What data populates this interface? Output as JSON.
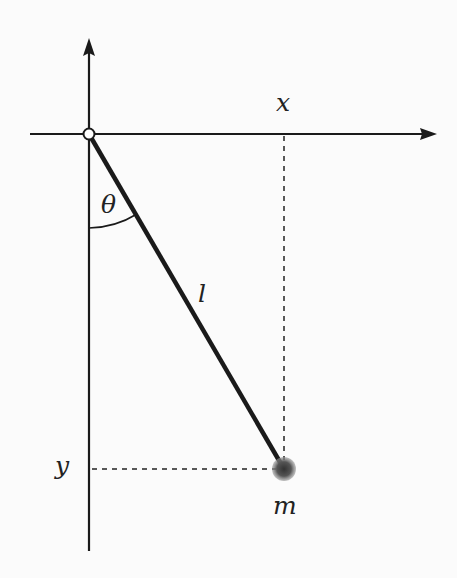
{
  "diagram": {
    "labels": {
      "x_axis": "x",
      "y_axis": "y",
      "angle": "θ",
      "length": "l",
      "mass": "m"
    },
    "geometry": {
      "origin": [
        89,
        134
      ],
      "x_axis_extent": [
        30,
        437
      ],
      "y_axis_extent": [
        38,
        551
      ],
      "bob": [
        284,
        469
      ],
      "bob_radius": 11
    },
    "colors": {
      "line": "#1a1a1a",
      "bob": "#555555",
      "background": "#fbfbfb"
    }
  }
}
